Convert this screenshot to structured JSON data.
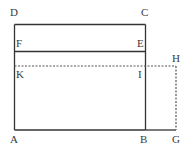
{
  "diagram": {
    "type": "geometric-rectangles",
    "colors": {
      "line": "#333333",
      "dashed": "#555555",
      "background": "#ffffff"
    },
    "points": {
      "D": {
        "label": "D",
        "x": 14.5,
        "y": 24.5
      },
      "C": {
        "label": "C",
        "x": 145.5,
        "y": 24.5
      },
      "F": {
        "label": "F",
        "x": 14.5,
        "y": 51.5
      },
      "E": {
        "label": "E",
        "x": 145.5,
        "y": 51.5
      },
      "K": {
        "label": "K",
        "x": 14.5,
        "y": 66
      },
      "I": {
        "label": "I",
        "x": 145.5,
        "y": 66
      },
      "H": {
        "label": "H",
        "x": 176,
        "y": 66
      },
      "A": {
        "label": "A",
        "x": 14.5,
        "y": 130
      },
      "B": {
        "label": "B",
        "x": 145.5,
        "y": 130
      },
      "G": {
        "label": "G",
        "x": 176,
        "y": 130
      }
    },
    "segments": [
      {
        "from": "D",
        "to": "C",
        "style": "solid"
      },
      {
        "from": "D",
        "to": "A",
        "style": "solid"
      },
      {
        "from": "C",
        "to": "B",
        "style": "solid"
      },
      {
        "from": "A",
        "to": "B",
        "style": "solid"
      },
      {
        "from": "F",
        "to": "E",
        "style": "solid"
      },
      {
        "from": "B",
        "to": "G",
        "style": "solid"
      },
      {
        "from": "K",
        "to": "H",
        "style": "dashed"
      },
      {
        "from": "H",
        "to": "G",
        "style": "dashed"
      }
    ]
  }
}
